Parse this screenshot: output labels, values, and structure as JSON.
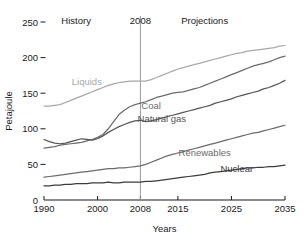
{
  "chart_data": {
    "type": "line",
    "title": "",
    "xlabel": "Years",
    "ylabel": "Petajoule",
    "xlim": [
      1990,
      2035
    ],
    "ylim": [
      0,
      250
    ],
    "grid": false,
    "legend_position": "inline-labels",
    "xticks": [
      1990,
      2000,
      2008,
      2015,
      2025,
      2035
    ],
    "xtick_labels": [
      "1990",
      "2000",
      "2008",
      "2015",
      "2025",
      "2035"
    ],
    "yticks": [
      0,
      50,
      100,
      150,
      200,
      250
    ],
    "ytick_labels": [
      "0",
      "50",
      "100",
      "150",
      "200",
      "250"
    ],
    "annotations": [
      {
        "name": "history",
        "text": "History",
        "x": 1996,
        "y": 247
      },
      {
        "name": "divider-year",
        "text": "2008",
        "x": 2008,
        "y": 247
      },
      {
        "name": "projections",
        "text": "Projections",
        "x": 2020,
        "y": 247
      }
    ],
    "divider": {
      "x": 2008,
      "color": "#9a9a9a"
    },
    "x": [
      1990,
      1991,
      1992,
      1993,
      1994,
      1995,
      1996,
      1997,
      1998,
      1999,
      2000,
      2001,
      2002,
      2003,
      2004,
      2005,
      2006,
      2007,
      2008,
      2009,
      2010,
      2011,
      2012,
      2013,
      2014,
      2015,
      2016,
      2017,
      2018,
      2019,
      2020,
      2021,
      2022,
      2023,
      2024,
      2025,
      2026,
      2027,
      2028,
      2029,
      2030,
      2031,
      2032,
      2033,
      2034,
      2035
    ],
    "series": [
      {
        "name": "Liquids",
        "color": "#a8a8a8",
        "label_x": 1998,
        "label_y": 162,
        "values": [
          132,
          132,
          133,
          134,
          137,
          140,
          143,
          146,
          149,
          152,
          155,
          158,
          161,
          163,
          165,
          166,
          167,
          167,
          167,
          167,
          169,
          172,
          175,
          178,
          181,
          184,
          186,
          188,
          190,
          192,
          194,
          196,
          198,
          200,
          202,
          204,
          206,
          207,
          209,
          210,
          211,
          212,
          213,
          214,
          216,
          217
        ]
      },
      {
        "name": "Coal",
        "color": "#6b6b6b",
        "label_x": 2010,
        "label_y": 128,
        "values": [
          73,
          74,
          75,
          77,
          78,
          79,
          80,
          81,
          83,
          85,
          88,
          92,
          100,
          110,
          120,
          126,
          131,
          134,
          136,
          138,
          141,
          144,
          146,
          148,
          150,
          151,
          152,
          154,
          156,
          158,
          161,
          164,
          167,
          170,
          173,
          176,
          179,
          182,
          185,
          188,
          190,
          192,
          194,
          197,
          200,
          202
        ]
      },
      {
        "name": "Natural gas",
        "color": "#555555",
        "label_x": 2012,
        "label_y": 110,
        "values": [
          85,
          82,
          80,
          79,
          80,
          82,
          84,
          86,
          85,
          84,
          86,
          90,
          95,
          99,
          103,
          106,
          109,
          111,
          112,
          110,
          111,
          113,
          115,
          117,
          119,
          121,
          123,
          125,
          127,
          129,
          131,
          133,
          136,
          138,
          140,
          142,
          145,
          147,
          149,
          151,
          153,
          156,
          158,
          161,
          164,
          168
        ]
      },
      {
        "name": "Renewables",
        "color": "#6b6b6b",
        "label_x": 2020,
        "label_y": 62,
        "values": [
          32,
          33,
          34,
          35,
          36,
          37,
          38,
          39,
          40,
          41,
          42,
          43,
          44,
          44,
          45,
          45,
          46,
          47,
          48,
          50,
          53,
          56,
          59,
          62,
          64,
          66,
          68,
          70,
          72,
          74,
          76,
          78,
          80,
          82,
          84,
          86,
          88,
          90,
          92,
          94,
          95,
          97,
          99,
          101,
          103,
          105
        ]
      },
      {
        "name": "Nuclear",
        "color": "#3c3c3c",
        "label_x": 2026,
        "label_y": 40,
        "values": [
          20,
          20,
          21,
          21,
          22,
          22,
          23,
          23,
          23,
          24,
          24,
          24,
          25,
          24,
          24,
          25,
          25,
          25,
          25,
          26,
          26,
          27,
          28,
          29,
          30,
          31,
          32,
          33,
          34,
          35,
          36,
          38,
          39,
          40,
          41,
          42,
          43,
          44,
          45,
          45,
          46,
          46,
          47,
          47,
          48,
          49
        ]
      }
    ]
  },
  "axis": {
    "y_title": "Petajoule",
    "x_title": "Years"
  }
}
